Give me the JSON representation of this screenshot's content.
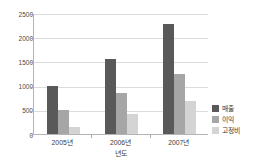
{
  "chart_data": {
    "type": "bar",
    "title": "",
    "subtitle": "",
    "xlabel": "년도",
    "ylabel": "",
    "categories": [
      "2005년",
      "2006년",
      "2007년"
    ],
    "series": [
      {
        "name": "매출",
        "color": "#595959",
        "values": [
          1000,
          1560,
          2280
        ]
      },
      {
        "name": "이익",
        "color": "#a6a6a6",
        "values": [
          490,
          850,
          1250
        ]
      },
      {
        "name": "고정비",
        "color": "#d4d4d4",
        "values": [
          150,
          410,
          680
        ]
      }
    ],
    "ylim": [
      0,
      2500
    ],
    "ytick_values": [
      0,
      500,
      1000,
      1500,
      2000,
      2500
    ],
    "ytick_labels": [
      "0",
      "500",
      "1000",
      "1500",
      "2000",
      "2500"
    ],
    "grid": true,
    "grid_axis": "y",
    "legend_position": "right",
    "axis_color": "#b4b4b4",
    "grid_color": "#dcdcdc",
    "background_color": "#ffffff"
  }
}
